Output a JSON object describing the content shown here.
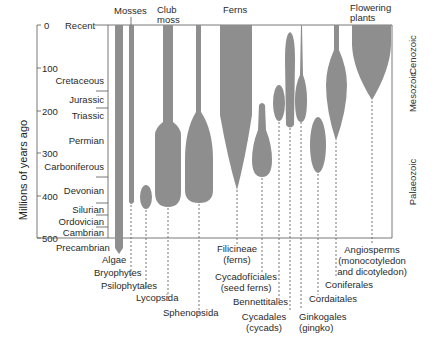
{
  "diagram": {
    "y_axis": {
      "label": "Millions of years ago",
      "ticks": [
        "0",
        "100",
        "200",
        "300",
        "400",
        "500"
      ]
    },
    "periods": [
      "Recent",
      "Cretaceous",
      "Jurassic",
      "Triassic",
      "Permian",
      "Carboniferous",
      "Devonian",
      "Silurian",
      "Ordovician",
      "Cambrian",
      "Precambrian"
    ],
    "eras": [
      "Cenozoic",
      "Mesozoic",
      "Palaeozoic"
    ],
    "top_labels": {
      "mosses": "Mosses",
      "club_moss_1": "Club",
      "club_moss_2": "moss",
      "ferns": "Ferns",
      "flowering_1": "Flowering",
      "flowering_2": "plants"
    },
    "groups": [
      {
        "name": "Algae"
      },
      {
        "name": "Bryophytes"
      },
      {
        "name": "Psilophytales"
      },
      {
        "name": "Lycopsida"
      },
      {
        "name": "Sphenopsida"
      },
      {
        "name": "Filicineae",
        "sub": "(ferns)"
      },
      {
        "name": "Cycadofíciales",
        "sub": "(seed ferns)"
      },
      {
        "name": "Bennettitales"
      },
      {
        "name": "Cycadales",
        "sub": "(cycads)"
      },
      {
        "name": "Ginkogales",
        "sub": "(gingko)"
      },
      {
        "name": "Cordaitales"
      },
      {
        "name": "Coniferales"
      },
      {
        "name": "Angiosperms",
        "sub": "(monocotyledon",
        "sub2": "and dicotyledon)"
      }
    ]
  }
}
